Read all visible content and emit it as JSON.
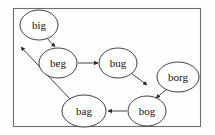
{
  "diagram": {
    "frame": {
      "x": 13,
      "y": 8,
      "width": 188,
      "height": 119,
      "stroke_color": "#6e6e6e",
      "background_color": "#fefefe"
    },
    "node_style": {
      "fill": "#ffffff",
      "stroke": "#2a2a2a",
      "text_color": "#111111"
    },
    "edge_style": {
      "stroke": "#2a2a2a",
      "arrowhead": "filled-triangle"
    },
    "nodes": [
      {
        "id": "big",
        "label": "big",
        "cx": 39,
        "cy": 25,
        "rx": 19,
        "ry": 15
      },
      {
        "id": "beg",
        "label": "beg",
        "cx": 58,
        "cy": 63,
        "rx": 19,
        "ry": 15
      },
      {
        "id": "bug",
        "label": "bug",
        "cx": 118,
        "cy": 63,
        "rx": 19,
        "ry": 15
      },
      {
        "id": "borg",
        "label": "borg",
        "cx": 178,
        "cy": 77,
        "rx": 21,
        "ry": 15
      },
      {
        "id": "bog",
        "label": "bog",
        "cx": 147,
        "cy": 111,
        "rx": 19,
        "ry": 15
      },
      {
        "id": "bag",
        "label": "bag",
        "cx": 84,
        "cy": 111,
        "rx": 22,
        "ry": 16
      }
    ],
    "edges": [
      {
        "id": "big-beg",
        "from": "big",
        "to": "beg",
        "x1": 47,
        "y1": 38,
        "x2": 55,
        "y2": 47
      },
      {
        "id": "beg-bug",
        "from": "beg",
        "to": "bug",
        "x1": 78,
        "y1": 63,
        "x2": 98,
        "y2": 63
      },
      {
        "id": "bug-bog",
        "from": "bug",
        "to": "bog",
        "x1": 131,
        "y1": 73,
        "x2": 147,
        "y2": 85
      },
      {
        "id": "borg-bog",
        "from": "borg",
        "to": "bog",
        "x1": 167,
        "y1": 89,
        "x2": 156,
        "y2": 98
      },
      {
        "id": "bog-bag",
        "from": "bog",
        "to": "bag",
        "x1": 127,
        "y1": 111,
        "x2": 108,
        "y2": 111
      },
      {
        "id": "bag-out",
        "from": "bag",
        "to": "exit",
        "x1": 70,
        "y1": 99,
        "x2": 21,
        "y2": 47
      }
    ]
  }
}
